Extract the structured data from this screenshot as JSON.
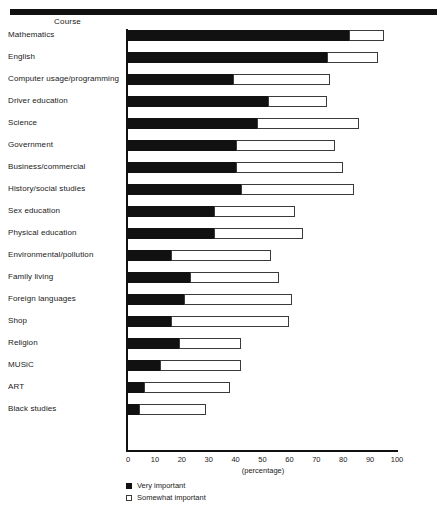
{
  "chart_data": {
    "type": "bar",
    "orientation": "horizontal",
    "stacked": true,
    "title": "",
    "column_header": "Course",
    "xlabel": "(percentage)",
    "ylabel": "Course",
    "xlim": [
      0,
      100
    ],
    "xticks": [
      0,
      10,
      20,
      30,
      40,
      50,
      60,
      70,
      80,
      90,
      100
    ],
    "xtick_labels": [
      "0",
      "10",
      "20",
      "30",
      "40",
      "50",
      "60",
      "70",
      "80",
      "90",
      "100"
    ],
    "grid": false,
    "legend_position": "bottom-left",
    "categories": [
      "Mathematics",
      "English",
      "Computer usage/programming",
      "Driver education",
      "Science",
      "Government",
      "Business/commercial",
      "History/social studies",
      "Sex education",
      "Physical education",
      "Environmental/pollution",
      "Family living",
      "Foreign languages",
      "Shop",
      "Religion",
      "MUSiC",
      "ART",
      "Black studies"
    ],
    "series": [
      {
        "name": "Very important",
        "color": "#111111",
        "values": [
          82,
          74,
          39,
          52,
          48,
          40,
          40,
          42,
          32,
          32,
          16,
          23,
          21,
          16,
          19,
          12,
          6,
          4
        ]
      },
      {
        "name": "Somewhat important",
        "color": "#ffffff",
        "values": [
          13,
          19,
          36,
          22,
          38,
          37,
          40,
          42,
          30,
          33,
          37,
          33,
          40,
          44,
          23,
          30,
          32,
          25
        ]
      }
    ],
    "cumulative_totals": [
      95,
      93,
      75,
      74,
      86,
      77,
      80,
      84,
      62,
      65,
      53,
      56,
      61,
      60,
      42,
      42,
      38,
      29
    ]
  },
  "legend": {
    "items": [
      {
        "label": "Very important",
        "swatch": "filled-square"
      },
      {
        "label": "Somewhat important",
        "swatch": "hollow-square"
      }
    ]
  }
}
